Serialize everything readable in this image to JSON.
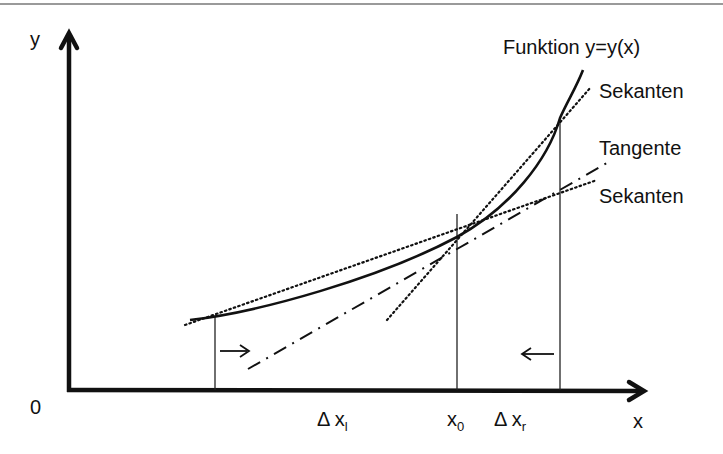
{
  "diagram": {
    "title": "Funktion y=y(x)",
    "axes": {
      "y_label": "y",
      "x_label": "x",
      "origin_label": "0"
    },
    "labels": {
      "function": "Funktion y=y(x)",
      "secant_upper": "Sekanten",
      "tangent": "Tangente",
      "secant_lower": "Sekanten",
      "delta_x_left_base": "Δ x",
      "delta_x_left_sub": "l",
      "x0_base": "x",
      "x0_sub": "0",
      "delta_x_right_base": "Δ x",
      "delta_x_right_sub": "r"
    },
    "arrows": {
      "left_arrow_direction": "right",
      "right_arrow_direction": "left"
    },
    "colors": {
      "line": "#111111",
      "top_border": "#9a9a9a",
      "background": "#ffffff"
    }
  }
}
